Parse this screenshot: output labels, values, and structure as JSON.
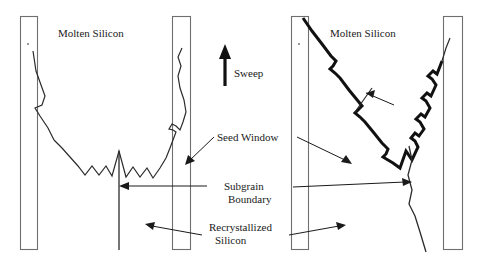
{
  "figure": {
    "background_color": "#ffffff",
    "line_color": "#2b2b2b",
    "bar_stroke_color": "#6f6f6f",
    "width": 487,
    "height": 262
  },
  "labels": {
    "molten_silicon_left": "Molten Silicon",
    "molten_silicon_right": "Molten Silicon",
    "sweep": "Sweep",
    "seed_window": "Seed Window",
    "subgrain_boundary_line1": "Subgrain",
    "subgrain_boundary_line2": "Boundary",
    "recrystallized_line1": "Recrystallized",
    "recrystallized_line2": "Silicon"
  },
  "panels": [
    {
      "name": "left-panel",
      "description": "Symmetric U-shaped solidification interface between two seed windows",
      "bars": [
        {
          "name": "seed-window-bar-1",
          "x": 20,
          "y": 16,
          "width": 17,
          "height": 233
        },
        {
          "name": "seed-window-bar-2",
          "x": 172,
          "y": 16,
          "width": 18,
          "height": 233
        }
      ],
      "subgrain_boundary": {
        "x": 119,
        "y_top": 151,
        "y_bottom": 250
      }
    },
    {
      "name": "right-panel",
      "description": "Asymmetric V-shaped solidification interface, thick faceted front",
      "bars": [
        {
          "name": "seed-window-bar-3",
          "x": 291,
          "y": 16,
          "width": 17,
          "height": 233
        },
        {
          "name": "seed-window-bar-4",
          "x": 443,
          "y": 16,
          "width": 19,
          "height": 233
        }
      ],
      "subgrain_boundary": {
        "x_top": 409,
        "y_top": 146,
        "x_bottom": 425,
        "y_bottom": 252
      }
    }
  ],
  "annotations": [
    {
      "name": "seed-window-arrow-left",
      "from": [
        213,
        136
      ],
      "to": [
        186,
        163
      ]
    },
    {
      "name": "seed-window-arrow-right",
      "from": [
        297,
        136
      ],
      "to": [
        349,
        163
      ]
    },
    {
      "name": "subgrain-arrow-left",
      "from": [
        206,
        186
      ],
      "to": [
        121,
        186
      ]
    },
    {
      "name": "subgrain-arrow-right",
      "from": [
        293,
        186
      ],
      "to": [
        412,
        183
      ]
    },
    {
      "name": "recrystallized-arrow-left",
      "from": [
        201,
        234
      ],
      "to": [
        146,
        224
      ]
    },
    {
      "name": "recrystallized-arrow-right",
      "from": [
        290,
        234
      ],
      "to": [
        345,
        225
      ]
    }
  ],
  "sweep_arrow": {
    "name": "sweep-arrow",
    "direction": "up",
    "x": 225,
    "y_tail": 84,
    "y_head": 48
  }
}
